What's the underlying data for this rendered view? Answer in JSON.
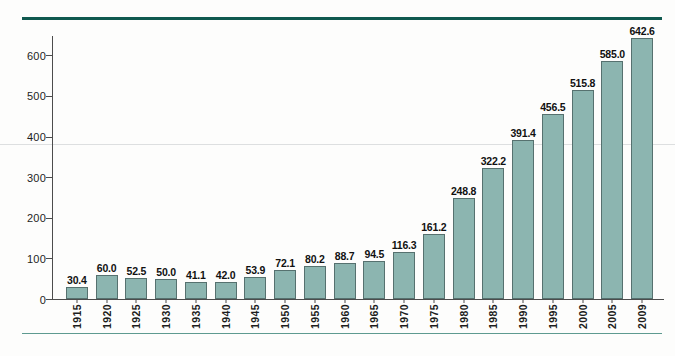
{
  "chart_data": {
    "type": "bar",
    "title": "",
    "subtitle": "",
    "xlabel": "",
    "ylabel": "",
    "ylim": [
      0,
      650
    ],
    "yticks": [
      0,
      100,
      200,
      300,
      400,
      500,
      600
    ],
    "ytick_labels": [
      "0",
      "100",
      "200",
      "300",
      "400",
      "500",
      "600"
    ],
    "grid": false,
    "legend": null,
    "orientation": "vertical",
    "bar_color": "#8cb5b0",
    "bar_edge_color": "#56716f",
    "value_label_format": "one-decimal",
    "categories": [
      "1915",
      "1920",
      "1925",
      "1930",
      "1935",
      "1940",
      "1945",
      "1950",
      "1955",
      "1960",
      "1965",
      "1970",
      "1975",
      "1980",
      "1985",
      "1990",
      "1995",
      "2000",
      "2005",
      "2009"
    ],
    "values": [
      30.4,
      60.0,
      52.5,
      50.0,
      41.1,
      42.0,
      53.9,
      72.1,
      80.2,
      88.7,
      94.5,
      116.3,
      161.2,
      248.8,
      322.2,
      391.4,
      456.5,
      515.8,
      585.0,
      642.6
    ],
    "value_labels": [
      "30.4",
      "60.0",
      "52.5",
      "50.0",
      "41.1",
      "42.0",
      "53.9",
      "72.1",
      "80.2",
      "88.7",
      "94.5",
      "116.3",
      "161.2",
      "248.8",
      "322.2",
      "391.4",
      "456.5",
      "515.8",
      "585.0",
      "642.6"
    ],
    "annotations": []
  },
  "decorations": {
    "top_rule_color": "#10594f",
    "bottom_rule_color": "#5e9a90"
  }
}
